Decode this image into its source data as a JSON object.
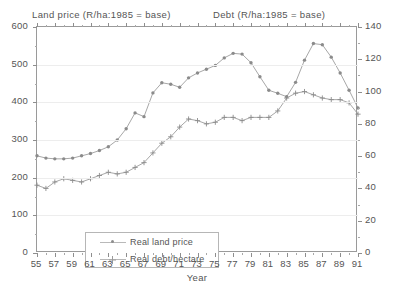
{
  "titles": {
    "left_axis_title": "Land price (R/ha:1985 = base)",
    "right_axis_title": "Debt (R/ha:1985 = base)",
    "x_axis_title": "Year"
  },
  "legend": {
    "items": [
      {
        "label": "Real land price",
        "marker": "dot-marker"
      },
      {
        "label": "Real debt/hectare",
        "marker": "plus-marker"
      }
    ]
  },
  "axes": {
    "left_ticks": [
      "600",
      "500",
      "400",
      "300",
      "200",
      "100",
      "0"
    ],
    "right_ticks": [
      "140",
      "120",
      "100",
      "80",
      "60",
      "40",
      "20",
      "0"
    ],
    "x_ticks": [
      "55",
      "57",
      "59",
      "61",
      "63",
      "65",
      "67",
      "69",
      "71",
      "73",
      "75",
      "77",
      "79",
      "81",
      "83",
      "85",
      "87",
      "89",
      "91"
    ]
  },
  "chart_data": {
    "type": "line",
    "title": "",
    "xlabel": "Year",
    "ylabel": "Land price (R/ha:1985 = base)",
    "y2label": "Debt (R/ha:1985 = base)",
    "ylim": [
      0,
      600
    ],
    "y2lim": [
      0,
      140
    ],
    "xlim": [
      55,
      91
    ],
    "grid": true,
    "legend_position": "lower-left-inside",
    "x": [
      55,
      56,
      57,
      58,
      59,
      60,
      61,
      62,
      63,
      64,
      65,
      66,
      67,
      68,
      69,
      70,
      71,
      72,
      73,
      74,
      75,
      76,
      77,
      78,
      79,
      80,
      81,
      82,
      83,
      84,
      85,
      86,
      87,
      88,
      89,
      90,
      91
    ],
    "series": [
      {
        "name": "Real land price",
        "axis": "left",
        "marker": "dot",
        "values": [
          258,
          252,
          250,
          250,
          252,
          258,
          264,
          272,
          282,
          300,
          330,
          372,
          362,
          425,
          452,
          448,
          440,
          465,
          478,
          488,
          498,
          518,
          530,
          528,
          505,
          468,
          432,
          424,
          415,
          453,
          512,
          556,
          553,
          520,
          478,
          432,
          385
        ]
      },
      {
        "name": "Real debt/hectare",
        "axis": "right",
        "marker": "plus",
        "values": [
          42,
          40,
          44,
          46,
          45,
          44,
          46,
          48,
          50,
          49,
          50,
          53,
          56,
          62,
          68,
          72,
          78,
          83,
          82,
          80,
          81,
          84,
          84,
          82,
          84,
          84,
          84,
          88,
          96,
          99,
          100,
          98,
          96,
          95,
          95,
          93,
          86
        ]
      }
    ]
  }
}
